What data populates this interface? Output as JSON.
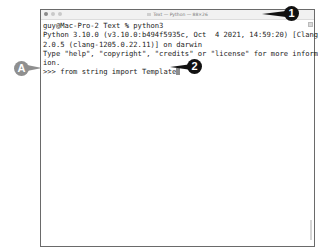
{
  "window": {
    "title": "Text — Python — 88×26",
    "traffic_lights": [
      "close",
      "minimize",
      "zoom"
    ]
  },
  "terminal": {
    "lines": [
      "guy@Mac-Pro-2 Text % python3",
      "Python 3.10.0 (v3.10.0:b494f5935c, Oct  4 2021, 14:59:20) [Clang 1",
      "2.0.5 (clang-1205.0.22.11)] on darwin",
      "Type \"help\", \"copyright\", \"credits\" or \"license\" for more informat",
      "ion."
    ],
    "prompt": ">>> ",
    "input": "from string import Template"
  },
  "callouts": {
    "one": "1",
    "two": "2",
    "a": "A"
  },
  "colors": {
    "callout_dark": "#111111",
    "callout_grey": "#8f8f8f",
    "cursor": "#8e8e8e"
  }
}
